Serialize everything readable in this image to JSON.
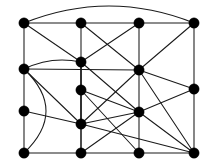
{
  "figure": {
    "name": "undirected-graph-drawing",
    "kind": "graph",
    "width": 203,
    "height": 163,
    "background_color": "#ffffff",
    "edge_color": "#1a1a1a",
    "vertex_color": "#000000",
    "vertex_radius": 5.2,
    "edge_width": 1.05,
    "vertex_count": 14,
    "edge_count": 38
  },
  "vertices": [
    {
      "id": "v1",
      "label": "v1",
      "x": 24,
      "y": 23
    },
    {
      "id": "v2",
      "label": "v2",
      "x": 81,
      "y": 23
    },
    {
      "id": "v3",
      "label": "v3",
      "x": 139,
      "y": 23
    },
    {
      "id": "v4",
      "label": "v4",
      "x": 194,
      "y": 23
    },
    {
      "id": "v5",
      "label": "v5",
      "x": 24,
      "y": 69
    },
    {
      "id": "v6",
      "label": "v6",
      "x": 81,
      "y": 62
    },
    {
      "id": "v7",
      "label": "v7",
      "x": 139,
      "y": 70
    },
    {
      "id": "v8",
      "label": "v8",
      "x": 194,
      "y": 89
    },
    {
      "id": "v9",
      "label": "v9",
      "x": 81,
      "y": 90
    },
    {
      "id": "v10",
      "label": "v10",
      "x": 24,
      "y": 111
    },
    {
      "id": "v11",
      "label": "v11",
      "x": 139,
      "y": 112
    },
    {
      "id": "v12",
      "label": "v12",
      "x": 81,
      "y": 124
    },
    {
      "id": "v13",
      "label": "v13",
      "x": 24,
      "y": 153
    },
    {
      "id": "v14",
      "label": "v14",
      "x": 81,
      "y": 153
    },
    {
      "id": "v15",
      "label": "v15",
      "x": 139,
      "y": 153
    },
    {
      "id": "v16",
      "label": "v16",
      "x": 194,
      "y": 153
    }
  ],
  "edges": [
    {
      "from": "v1",
      "to": "v2",
      "type": "straight"
    },
    {
      "from": "v2",
      "to": "v3",
      "type": "straight"
    },
    {
      "from": "v3",
      "to": "v4",
      "type": "straight"
    },
    {
      "from": "v1",
      "to": "v4",
      "type": "curved",
      "bow": -17
    },
    {
      "from": "v1",
      "to": "v5",
      "type": "straight"
    },
    {
      "from": "v1",
      "to": "v6",
      "type": "straight"
    },
    {
      "from": "v2",
      "to": "v6",
      "type": "straight"
    },
    {
      "from": "v2",
      "to": "v7",
      "type": "straight"
    },
    {
      "from": "v3",
      "to": "v6",
      "type": "straight"
    },
    {
      "from": "v3",
      "to": "v7",
      "type": "straight"
    },
    {
      "from": "v4",
      "to": "v7",
      "type": "straight"
    },
    {
      "from": "v4",
      "to": "v8",
      "type": "straight"
    },
    {
      "from": "v5",
      "to": "v6",
      "type": "curved",
      "bow": -5
    },
    {
      "from": "v5",
      "to": "v7",
      "type": "straight"
    },
    {
      "from": "v5",
      "to": "v10",
      "type": "straight"
    },
    {
      "from": "v5",
      "to": "v12",
      "type": "straight"
    },
    {
      "from": "v5",
      "to": "v13",
      "type": "curved",
      "bow": -22
    },
    {
      "from": "v6",
      "to": "v9",
      "type": "straight"
    },
    {
      "from": "v6",
      "to": "v11",
      "type": "straight"
    },
    {
      "from": "v6",
      "to": "v12",
      "type": "straight"
    },
    {
      "from": "v6",
      "to": "v14",
      "type": "straight"
    },
    {
      "from": "v7",
      "to": "v8",
      "type": "straight"
    },
    {
      "from": "v7",
      "to": "v11",
      "type": "straight"
    },
    {
      "from": "v7",
      "to": "v12",
      "type": "straight"
    },
    {
      "from": "v7",
      "to": "v16",
      "type": "straight"
    },
    {
      "from": "v8",
      "to": "v11",
      "type": "straight"
    },
    {
      "from": "v8",
      "to": "v16",
      "type": "straight"
    },
    {
      "from": "v9",
      "to": "v11",
      "type": "straight"
    },
    {
      "from": "v9",
      "to": "v12",
      "type": "straight"
    },
    {
      "from": "v9",
      "to": "v15",
      "type": "straight"
    },
    {
      "from": "v10",
      "to": "v12",
      "type": "straight"
    },
    {
      "from": "v10",
      "to": "v13",
      "type": "straight"
    },
    {
      "from": "v11",
      "to": "v12",
      "type": "straight"
    },
    {
      "from": "v11",
      "to": "v14",
      "type": "straight"
    },
    {
      "from": "v11",
      "to": "v15",
      "type": "straight"
    },
    {
      "from": "v11",
      "to": "v16",
      "type": "straight"
    },
    {
      "from": "v12",
      "to": "v14",
      "type": "straight"
    },
    {
      "from": "v12",
      "to": "v16",
      "type": "straight"
    },
    {
      "from": "v13",
      "to": "v14",
      "type": "straight"
    },
    {
      "from": "v14",
      "to": "v15",
      "type": "straight"
    },
    {
      "from": "v15",
      "to": "v16",
      "type": "straight"
    }
  ]
}
